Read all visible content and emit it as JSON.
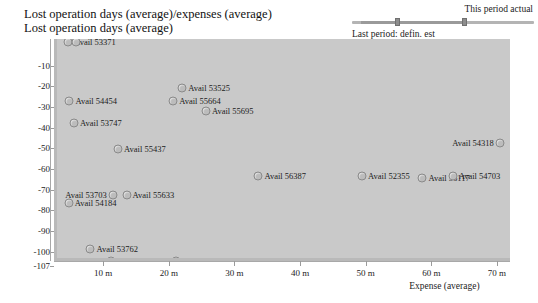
{
  "title": {
    "line1": "Lost operation days (average)/expenses (average)",
    "line2": "Lost operation days (average)"
  },
  "period_control": {
    "this_period_label": "This period actual",
    "last_period_label": "Last period: defin. est",
    "handles": [
      "left-handle",
      "right-handle"
    ]
  },
  "chart_data": {
    "type": "scatter",
    "title": "Lost operation days (average)/expenses (average)",
    "subtitle": "Lost operation days (average)",
    "xlabel": "Expense (average)",
    "ylabel": "Lost operation days (average)",
    "xlim": [
      2.5,
      72
    ],
    "ylim": [
      -107,
      0.5
    ],
    "grid": false,
    "legend": "none",
    "xticks": [
      10,
      20,
      30,
      40,
      50,
      60,
      70
    ],
    "xtick_labels": [
      "10 m",
      "20 m",
      "30 m",
      "40 m",
      "50 m",
      "60 m",
      "70 m"
    ],
    "yticks": [
      -10,
      -20,
      -30,
      -40,
      -50,
      -60,
      -70,
      -80,
      -90,
      -100,
      -107
    ],
    "ytick_labels": [
      "-10",
      "-20",
      "-30",
      "-40",
      "-50",
      "-60",
      "-70",
      "-80",
      "-90",
      "-100",
      "-107"
    ],
    "points": [
      {
        "label": "Avail 53371",
        "x": 4.2,
        "y": -1,
        "label_side": "right"
      },
      {
        "label": "Avail 53371b",
        "x": 5.4,
        "y": -1,
        "label_side": "none"
      },
      {
        "label": "Avail 53525",
        "x": 21.6,
        "y": -23,
        "label_side": "right"
      },
      {
        "label": "Avail 54454",
        "x": 4.4,
        "y": -29.5,
        "label_side": "right"
      },
      {
        "label": "Avail 55664",
        "x": 20.2,
        "y": -29.5,
        "label_side": "right"
      },
      {
        "label": "Avail 55695",
        "x": 25.2,
        "y": -34.5,
        "label_side": "right"
      },
      {
        "label": "Avail 53747",
        "x": 5.1,
        "y": -40,
        "label_side": "right"
      },
      {
        "label": "Avail 54318",
        "x": 70.0,
        "y": -50,
        "label_side": "left"
      },
      {
        "label": "Avail 55437",
        "x": 11.8,
        "y": -53,
        "label_side": "right"
      },
      {
        "label": "Avail 56387",
        "x": 33.2,
        "y": -66,
        "label_side": "right"
      },
      {
        "label": "Avail 52355",
        "x": 49.0,
        "y": -66,
        "label_side": "right"
      },
      {
        "label": "Avail 56117",
        "x": 58.2,
        "y": -67,
        "label_side": "right"
      },
      {
        "label": "Avail 54703",
        "x": 62.8,
        "y": -66,
        "label_side": "right"
      },
      {
        "label": "Avail 55633",
        "x": 13.1,
        "y": -75,
        "label_side": "right"
      },
      {
        "label": "Avail 53703",
        "x": 11.0,
        "y": -75,
        "label_side": "left"
      },
      {
        "label": "Avail 54184",
        "x": 4.3,
        "y": -79,
        "label_side": "right"
      },
      {
        "label": "Avail 53762",
        "x": 7.6,
        "y": -101,
        "label_side": "right"
      },
      {
        "label": "Avail 57133",
        "x": 10.7,
        "y": -107,
        "label_side": "right"
      },
      {
        "label": "Avail 55696",
        "x": 20.6,
        "y": -107,
        "label_side": "right"
      }
    ]
  }
}
